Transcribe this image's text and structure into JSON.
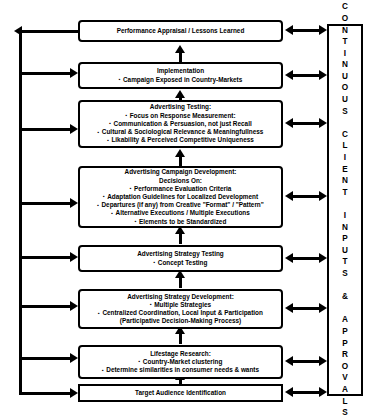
{
  "diagram": {
    "colors": {
      "line": "#000000",
      "background": "#ffffff",
      "text": "#000000"
    },
    "client_column": {
      "label": "C\nO\nN\nT\nI\nN\nU\nO\nU\nS\n\nC\nL\nI\nE\nN\nT\n\nI\nN\nP\nU\nT\nS\n\n&\n\nA\nP\nP\nR\nO\nV\nA\nL\nS",
      "plain_text": "CONTINUOUS CLIENT INPUTS & APPROVALS"
    },
    "boxes": [
      {
        "id": "performance-appraisal",
        "title": "Performance Appraisal / Lessons Learned",
        "bullets": []
      },
      {
        "id": "implementation",
        "title": "Implementation",
        "bullets": [
          "Campaign Exposed in Country-Markets"
        ]
      },
      {
        "id": "advertising-testing",
        "title": "Advertising Testing:",
        "bullets": [
          "Focus on Response Measurement:",
          "Communication & Persuasion, not just Recall",
          "Cultural & Sociological Relevance & Meaningfullness",
          "Likability & Perceived Competitive Uniqueness"
        ]
      },
      {
        "id": "advertising-campaign-development",
        "title": "Advertising Campaign Development:",
        "subtitle": "Decisions On:",
        "bullets": [
          "Performance Evaluation Criteria",
          "Adaptation Guidelines for Localized Development",
          "Departures (if any) from Creative \"Format\" / \"Pattern\"",
          "Alternative Executions / Multiple Executions",
          "Elements to be Standardized"
        ]
      },
      {
        "id": "advertising-strategy-testing",
        "title": "Advertising Strategy Testing",
        "bullets": [
          "Concept Testing"
        ]
      },
      {
        "id": "advertising-strategy-development",
        "title": "Advertising Strategy Development:",
        "bullets": [
          "Multiple Strategies",
          "Centralized Coordination, Local Input & Participation"
        ],
        "note": "(Participative Decision-Making Process)"
      },
      {
        "id": "lifestage-research",
        "title": "Lifestage Research:",
        "bullets": [
          "Country-Market clustering",
          "Determine similarities in consumer needs & wants"
        ]
      },
      {
        "id": "target-audience-identification",
        "title": "Target Audience Identification",
        "bullets": []
      }
    ]
  }
}
